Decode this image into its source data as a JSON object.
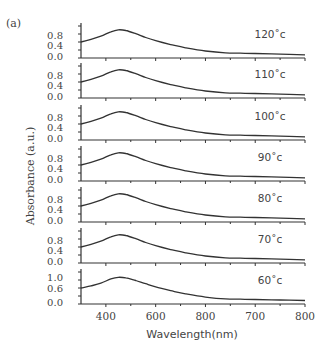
{
  "panel_label": "(a)",
  "y_axis_label": "Absorbance (a.u.)",
  "x_axis_label": "Wavelength(nm)",
  "x_tick_labels": [
    "400",
    "600",
    "800",
    "700",
    "800"
  ],
  "colors": {
    "line": "#333333",
    "text": "#444444"
  },
  "chart_data": {
    "type": "line",
    "title": "",
    "xlabel": "Wavelength(nm)",
    "ylabel": "Absorbance (a.u.)",
    "xlim": [
      350,
      800
    ],
    "x_tick_labels_rendered": [
      "400",
      "600",
      "800",
      "700",
      "800"
    ],
    "x": [
      350,
      370,
      390,
      410,
      425,
      440,
      460,
      480,
      500,
      530,
      560,
      600,
      640,
      670,
      700,
      750,
      800
    ],
    "panels": [
      {
        "name": "120°c",
        "label": "120˚c",
        "ytick_labels": [
          "0.8",
          "0.4",
          "0.0"
        ],
        "ylim": [
          0,
          1.0
        ],
        "values": [
          0.5,
          0.58,
          0.68,
          0.82,
          0.88,
          0.86,
          0.76,
          0.64,
          0.54,
          0.42,
          0.32,
          0.22,
          0.16,
          0.15,
          0.14,
          0.12,
          0.1
        ]
      },
      {
        "name": "110°c",
        "label": "110˚c",
        "ytick_labels": [
          "0.8",
          "0.4",
          "0.0"
        ],
        "ylim": [
          0,
          1.0
        ],
        "values": [
          0.5,
          0.58,
          0.68,
          0.82,
          0.88,
          0.86,
          0.76,
          0.64,
          0.54,
          0.42,
          0.32,
          0.22,
          0.16,
          0.15,
          0.14,
          0.12,
          0.1
        ]
      },
      {
        "name": "100°c",
        "label": "100˚c",
        "ytick_labels": [
          "0.8",
          "0.4",
          "0.0"
        ],
        "ylim": [
          0,
          1.0
        ],
        "values": [
          0.5,
          0.58,
          0.68,
          0.82,
          0.88,
          0.86,
          0.76,
          0.64,
          0.54,
          0.42,
          0.32,
          0.22,
          0.16,
          0.15,
          0.14,
          0.12,
          0.1
        ]
      },
      {
        "name": "90°c",
        "label": "90˚c",
        "ytick_labels": [
          "0.8",
          "0.4",
          "0.0"
        ],
        "ylim": [
          0,
          1.0
        ],
        "values": [
          0.5,
          0.58,
          0.68,
          0.82,
          0.88,
          0.86,
          0.76,
          0.64,
          0.54,
          0.42,
          0.32,
          0.22,
          0.16,
          0.15,
          0.14,
          0.12,
          0.1
        ]
      },
      {
        "name": "80°c",
        "label": "80˚c",
        "ytick_labels": [
          "0.8",
          "0.4",
          "0.0"
        ],
        "ylim": [
          0,
          1.0
        ],
        "values": [
          0.5,
          0.58,
          0.68,
          0.82,
          0.88,
          0.86,
          0.76,
          0.64,
          0.54,
          0.42,
          0.32,
          0.22,
          0.16,
          0.15,
          0.14,
          0.12,
          0.1
        ]
      },
      {
        "name": "70°c",
        "label": "70˚c",
        "ytick_labels": [
          "0.8",
          "0.4",
          "0.0"
        ],
        "ylim": [
          0,
          1.0
        ],
        "values": [
          0.5,
          0.58,
          0.68,
          0.82,
          0.88,
          0.86,
          0.76,
          0.64,
          0.54,
          0.42,
          0.32,
          0.22,
          0.16,
          0.15,
          0.14,
          0.12,
          0.1
        ]
      },
      {
        "name": "60°c",
        "label": "60˚c",
        "ytick_labels": [
          "1.0",
          "0.6",
          "0.0"
        ],
        "ylim": [
          0,
          1.2
        ],
        "values": [
          0.6,
          0.68,
          0.78,
          0.94,
          1.0,
          0.98,
          0.88,
          0.76,
          0.64,
          0.5,
          0.38,
          0.26,
          0.19,
          0.18,
          0.17,
          0.15,
          0.13
        ]
      }
    ],
    "grid": false,
    "legend": "inline temperature labels at upper right of each panel"
  }
}
